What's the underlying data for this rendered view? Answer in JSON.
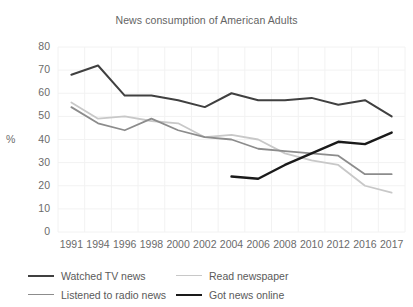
{
  "chart_data": {
    "type": "line",
    "title": "News consumption of American Adults",
    "xlabel": "",
    "ylabel": "%",
    "ylim": [
      0,
      80
    ],
    "ytick_step": 10,
    "yticks": [
      80,
      70,
      60,
      50,
      40,
      30,
      20,
      10,
      0
    ],
    "grid": true,
    "legend_position": "bottom",
    "categories": [
      "1991",
      "1994",
      "1996",
      "1998",
      "2000",
      "2002",
      "2004",
      "2006",
      "2008",
      "2010",
      "2012",
      "2016",
      "2017"
    ],
    "series": [
      {
        "name": "Watched TV news",
        "color": "#404040",
        "width": 2.0,
        "values": [
          68,
          72,
          59,
          59,
          57,
          54,
          60,
          57,
          57,
          58,
          55,
          57,
          50
        ]
      },
      {
        "name": "Read newspaper",
        "color": "#c8c8c8",
        "width": 1.8,
        "values": [
          56,
          49,
          50,
          48,
          47,
          41,
          42,
          40,
          34,
          31,
          29,
          20,
          17
        ]
      },
      {
        "name": "Listened to radio news",
        "color": "#8c8c8c",
        "width": 1.8,
        "values": [
          54,
          47,
          44,
          49,
          44,
          41,
          40,
          36,
          35,
          34,
          33,
          25,
          25
        ]
      },
      {
        "name": "Got news online",
        "color": "#1a1a1a",
        "width": 2.4,
        "values": [
          null,
          null,
          null,
          null,
          null,
          null,
          24,
          23,
          29,
          34,
          39,
          38,
          43
        ]
      }
    ]
  },
  "legend": {
    "items": [
      {
        "label": "Watched TV news",
        "color": "#404040",
        "width": 2.0
      },
      {
        "label": "Read newspaper",
        "color": "#c8c8c8",
        "width": 1.8
      },
      {
        "label": "Listened to radio news",
        "color": "#8c8c8c",
        "width": 1.8
      },
      {
        "label": "Got news online",
        "color": "#1a1a1a",
        "width": 2.6
      }
    ]
  },
  "style": {
    "background": "#ffffff",
    "grid_color": "#f2f2f2",
    "text_color": "#6b6b6b"
  }
}
